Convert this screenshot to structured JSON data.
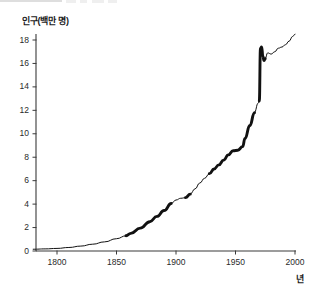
{
  "chart_data": {
    "type": "line",
    "title": "",
    "subtitle": "",
    "ylabel": "인구(백만 명)",
    "xlabel": "년",
    "xlim": [
      1780,
      2005
    ],
    "ylim": [
      0,
      19.2
    ],
    "yticks": [
      0,
      2,
      4,
      6,
      8,
      10,
      12,
      14,
      16,
      18
    ],
    "ytick_labels": [
      "0",
      "2",
      "4",
      "6",
      "8",
      "10",
      "12",
      "14",
      "16",
      "18"
    ],
    "xticks": [
      1800,
      1850,
      1900,
      1950,
      2000
    ],
    "xtick_labels": [
      "1800",
      "1850",
      "1900",
      "1950",
      "2000"
    ],
    "grid": false,
    "legend": false,
    "line_color": "#111111",
    "axis_color": "#3a3a3a",
    "series": [
      {
        "name": "인구",
        "x": [
          1780,
          1790,
          1800,
          1810,
          1820,
          1830,
          1840,
          1850,
          1858,
          1862,
          1870,
          1878,
          1884,
          1890,
          1896,
          1900,
          1904,
          1908,
          1912,
          1916,
          1920,
          1924,
          1928,
          1932,
          1936,
          1940,
          1944,
          1948,
          1952,
          1956,
          1958,
          1962,
          1966,
          1969,
          1970,
          1971,
          1972,
          1973,
          1974,
          1975,
          1977,
          1980,
          1983,
          1986,
          1989,
          1992,
          1995,
          1998,
          2000
        ],
        "y": [
          0.15,
          0.18,
          0.22,
          0.3,
          0.42,
          0.58,
          0.78,
          1.05,
          1.3,
          1.5,
          1.95,
          2.5,
          2.95,
          3.45,
          4.05,
          4.35,
          4.5,
          4.55,
          4.85,
          5.3,
          5.8,
          6.2,
          6.6,
          7.0,
          7.35,
          7.75,
          8.2,
          8.55,
          8.6,
          8.9,
          9.6,
          10.7,
          11.8,
          12.6,
          12.8,
          17.3,
          17.4,
          16.6,
          16.25,
          16.4,
          16.9,
          16.8,
          17.0,
          17.3,
          17.4,
          17.6,
          17.9,
          18.3,
          18.5
        ]
      }
    ],
    "thick_segments": [
      {
        "from": 1858,
        "to": 1896,
        "note": "bold stroke"
      },
      {
        "from": 1906,
        "to": 1913,
        "note": "bold stroke"
      },
      {
        "from": 1928,
        "to": 1936,
        "note": "bold stroke"
      },
      {
        "from": 1940,
        "to": 1956,
        "note": "bold stroke"
      },
      {
        "from": 1958,
        "to": 1966,
        "note": "bold stroke"
      },
      {
        "from": 1970,
        "to": 1975,
        "note": "bold stroke"
      }
    ],
    "annotations": [
      {
        "text": "sharp vertical rise near 1970",
        "x": 1970,
        "y": 17.3
      }
    ]
  },
  "axes": {
    "y_tick_labels": [
      "18",
      "16",
      "14",
      "12",
      "10",
      "8",
      "6",
      "4",
      "2",
      "0"
    ],
    "x_tick_labels": [
      "1800",
      "1850",
      "1900",
      "1950",
      "2000"
    ]
  },
  "labels": {
    "y_axis_title": "인구(백만 명)",
    "x_axis_title": "년"
  }
}
